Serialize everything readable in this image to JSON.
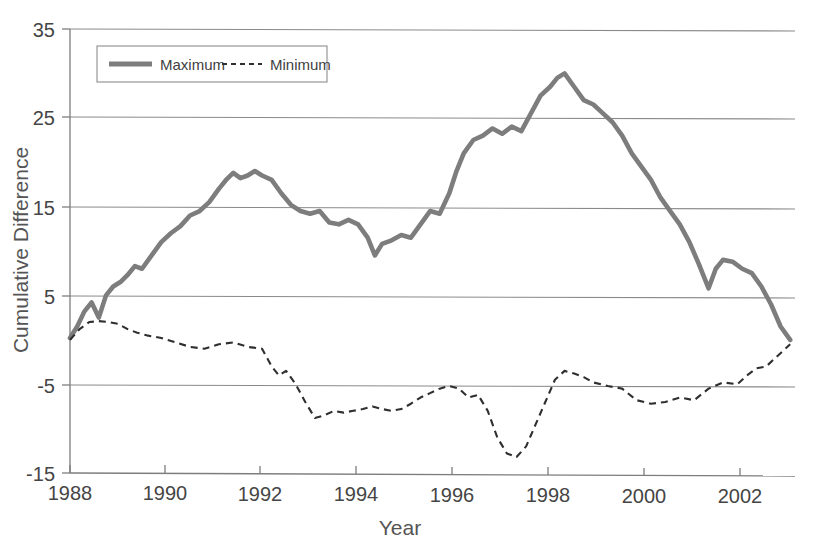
{
  "chart_data": {
    "type": "line",
    "title": "",
    "xlabel": "Year",
    "ylabel": "Cumulative Difference",
    "xlim": [
      1988,
      2003.1
    ],
    "ylim": [
      -15,
      35
    ],
    "xticks": [
      1988,
      1990,
      1992,
      1994,
      1996,
      1998,
      2000,
      2002
    ],
    "xticklabels": [
      "1988",
      "1990",
      "1992",
      "1994",
      "1996",
      "1998",
      "2000",
      "2002"
    ],
    "yticks": [
      -15,
      -5,
      5,
      15,
      25,
      35
    ],
    "yticklabels": [
      "-15",
      "-5",
      "5",
      "15",
      "25",
      "35"
    ],
    "grid": "horizontal",
    "legend_position": "top-left",
    "legend_entries": [
      "Maximum",
      "Minimum"
    ],
    "colors": {
      "maximum": "#7d7d7d",
      "minimum": "#2f2f2f",
      "grid": "#8a8a8a",
      "axis": "#7d7d7d",
      "text": "#454545",
      "background": "#ffffff"
    },
    "series": [
      {
        "name": "Maximum",
        "style": "solid-thick",
        "x": [
          1988.0,
          1988.15,
          1988.3,
          1988.45,
          1988.6,
          1988.75,
          1988.9,
          1989.05,
          1989.2,
          1989.35,
          1989.5,
          1989.7,
          1989.9,
          1990.1,
          1990.3,
          1990.5,
          1990.7,
          1990.9,
          1991.1,
          1991.25,
          1991.4,
          1991.55,
          1991.7,
          1991.85,
          1992.0,
          1992.2,
          1992.4,
          1992.6,
          1992.8,
          1993.0,
          1993.2,
          1993.4,
          1993.6,
          1993.8,
          1994.0,
          1994.2,
          1994.35,
          1994.5,
          1994.7,
          1994.9,
          1995.1,
          1995.3,
          1995.5,
          1995.7,
          1995.9,
          1996.05,
          1996.2,
          1996.4,
          1996.6,
          1996.8,
          1997.0,
          1997.2,
          1997.4,
          1997.6,
          1997.8,
          1998.0,
          1998.15,
          1998.3,
          1998.5,
          1998.7,
          1998.9,
          1999.1,
          1999.3,
          1999.5,
          1999.7,
          1999.9,
          2000.1,
          2000.3,
          2000.5,
          2000.7,
          2000.9,
          2001.1,
          2001.3,
          2001.45,
          2001.6,
          2001.8,
          2002.0,
          2002.2,
          2002.4,
          2002.6,
          2002.8,
          2003.0
        ],
        "y": [
          0.2,
          1.5,
          3.2,
          4.2,
          2.5,
          5.0,
          6.0,
          6.5,
          7.3,
          8.3,
          8.0,
          9.5,
          11.0,
          12.0,
          12.8,
          14.0,
          14.5,
          15.5,
          17.0,
          18.0,
          18.8,
          18.2,
          18.5,
          19.0,
          18.5,
          18.0,
          16.5,
          15.2,
          14.5,
          14.2,
          14.5,
          13.2,
          13.0,
          13.5,
          13.0,
          11.5,
          9.5,
          10.8,
          11.2,
          11.8,
          11.5,
          13.0,
          14.5,
          14.2,
          16.5,
          19.0,
          21.0,
          22.5,
          23.0,
          23.8,
          23.2,
          24.0,
          23.5,
          25.5,
          27.5,
          28.5,
          29.5,
          30.0,
          28.5,
          27.0,
          26.5,
          25.5,
          24.5,
          23.0,
          21.0,
          19.5,
          18.0,
          16.0,
          14.5,
          13.0,
          11.0,
          8.5,
          5.8,
          8.0,
          9.0,
          8.8,
          8.0,
          7.5,
          6.0,
          4.0,
          1.5,
          0.0
        ]
      },
      {
        "name": "Minimum",
        "style": "dashed",
        "x": [
          1988.0,
          1988.2,
          1988.4,
          1988.6,
          1988.8,
          1989.0,
          1989.2,
          1989.4,
          1989.6,
          1989.9,
          1990.2,
          1990.5,
          1990.8,
          1991.1,
          1991.4,
          1991.7,
          1992.0,
          1992.2,
          1992.35,
          1992.5,
          1992.7,
          1992.9,
          1993.1,
          1993.3,
          1993.5,
          1993.7,
          1993.9,
          1994.1,
          1994.3,
          1994.5,
          1994.7,
          1994.9,
          1995.1,
          1995.3,
          1995.5,
          1995.7,
          1995.9,
          1996.1,
          1996.3,
          1996.5,
          1996.7,
          1996.9,
          1997.1,
          1997.3,
          1997.5,
          1997.7,
          1997.9,
          1998.1,
          1998.3,
          1998.5,
          1998.7,
          1998.9,
          1999.2,
          1999.5,
          1999.8,
          2000.1,
          2000.4,
          2000.7,
          2001.0,
          2001.3,
          2001.6,
          2001.9,
          2002.1,
          2002.3,
          2002.5,
          2002.7,
          2003.0
        ],
        "y": [
          0.0,
          1.2,
          2.0,
          2.1,
          2.0,
          1.8,
          1.2,
          0.8,
          0.5,
          0.2,
          -0.3,
          -0.8,
          -1.0,
          -0.5,
          -0.3,
          -0.8,
          -1.0,
          -3.0,
          -4.0,
          -3.5,
          -5.0,
          -7.0,
          -8.8,
          -8.5,
          -8.0,
          -8.2,
          -8.0,
          -7.8,
          -7.5,
          -7.8,
          -8.0,
          -7.8,
          -7.2,
          -6.5,
          -6.0,
          -5.5,
          -5.2,
          -5.5,
          -6.5,
          -6.2,
          -8.0,
          -11.0,
          -12.8,
          -13.2,
          -12.0,
          -9.5,
          -7.0,
          -4.5,
          -3.5,
          -3.8,
          -4.2,
          -4.8,
          -5.2,
          -5.5,
          -6.8,
          -7.2,
          -7.0,
          -6.5,
          -6.8,
          -5.5,
          -4.8,
          -5.0,
          -4.0,
          -3.2,
          -3.0,
          -2.0,
          -0.5
        ]
      }
    ]
  },
  "legend": {
    "maximum_label": "Maximum",
    "minimum_label": "Minimum"
  },
  "axes": {
    "y_title": "Cumulative Difference",
    "x_title": "Year"
  }
}
